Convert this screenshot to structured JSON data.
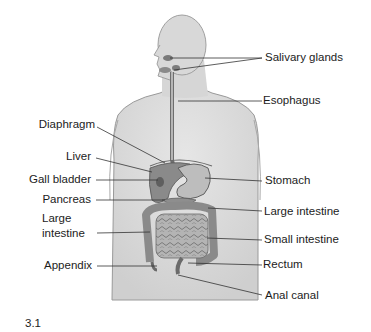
{
  "figure": {
    "number": "3.1"
  },
  "labels": {
    "right": [
      {
        "id": "salivary-glands",
        "text": "Salivary glands"
      },
      {
        "id": "esophagus",
        "text": "Esophagus"
      },
      {
        "id": "stomach",
        "text": "Stomach"
      },
      {
        "id": "large-intestine-right",
        "text": "Large intestine"
      },
      {
        "id": "small-intestine",
        "text": "Small intestine"
      },
      {
        "id": "rectum",
        "text": "Rectum"
      },
      {
        "id": "anal-canal",
        "text": "Anal canal"
      }
    ],
    "left": [
      {
        "id": "diaphragm",
        "text": "Diaphragm"
      },
      {
        "id": "liver",
        "text": "Liver"
      },
      {
        "id": "gall-bladder",
        "text": "Gall bladder"
      },
      {
        "id": "pancreas",
        "text": "Pancreas"
      },
      {
        "id": "large-intestine-left",
        "line1": "Large",
        "line2": "intestine"
      },
      {
        "id": "appendix",
        "text": "Appendix"
      }
    ]
  },
  "colors": {
    "body_fill": "#d9d9d9",
    "body_outline": "#8a8a8a",
    "organ_fill": "#a9a9a9",
    "organ_dark": "#6f6f6f",
    "leader_line": "#333333",
    "text": "#1c1c1c"
  }
}
